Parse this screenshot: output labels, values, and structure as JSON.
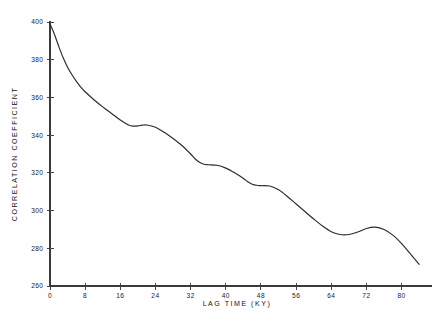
{
  "chart_data": {
    "type": "line",
    "title": "",
    "xlabel": "LAG  TIME  (KY)",
    "ylabel": "CORRELATION COEFFICIENT",
    "xlim": [
      0,
      86
    ],
    "ylim": [
      260,
      400
    ],
    "xticks": [
      0,
      8,
      16,
      24,
      32,
      40,
      48,
      56,
      64,
      72,
      80
    ],
    "xtick_labels": [
      "0",
      "8",
      "16",
      "24",
      "32",
      "40",
      "48",
      "56",
      "64",
      "72",
      "80"
    ],
    "yticks": [
      260,
      280,
      300,
      320,
      340,
      360,
      380,
      400
    ],
    "ytick_labels": [
      "260",
      "280",
      "300",
      "320",
      "340",
      "360",
      "380",
      "400"
    ],
    "grid": false,
    "legend": false,
    "series": [
      {
        "name": "correlation coefficient",
        "color": "#2b2b2b",
        "x": [
          0,
          1,
          2,
          3,
          4,
          5,
          6,
          7,
          8,
          10,
          12,
          14,
          16,
          18,
          19,
          20,
          21,
          22,
          24,
          26,
          28,
          30,
          32,
          33,
          34,
          35,
          36,
          38,
          40,
          42,
          44,
          45,
          46,
          47,
          48,
          50,
          52,
          54,
          56,
          58,
          60,
          62,
          64,
          66,
          68,
          70,
          72,
          74,
          76,
          78,
          80,
          82,
          84
        ],
        "y": [
          399.0,
          393.5,
          387.0,
          381.0,
          376.0,
          372.0,
          368.5,
          365.5,
          363.0,
          358.8,
          355.0,
          351.5,
          348.0,
          345.2,
          344.8,
          344.9,
          345.3,
          345.4,
          344.2,
          341.5,
          338.2,
          334.5,
          330.0,
          327.5,
          325.6,
          324.6,
          324.3,
          324.0,
          322.5,
          320.0,
          317.0,
          315.3,
          314.0,
          313.4,
          313.2,
          313.0,
          311.0,
          307.5,
          303.5,
          299.5,
          295.5,
          291.8,
          288.8,
          287.3,
          287.3,
          288.6,
          290.5,
          291.2,
          290.0,
          287.0,
          282.5,
          277.0,
          271.5
        ]
      }
    ],
    "annotations": []
  },
  "axes": {
    "y_axis_title": "CORRELATION COEFFICIENT",
    "x_axis_title": "LAG  TIME  (KY)"
  }
}
